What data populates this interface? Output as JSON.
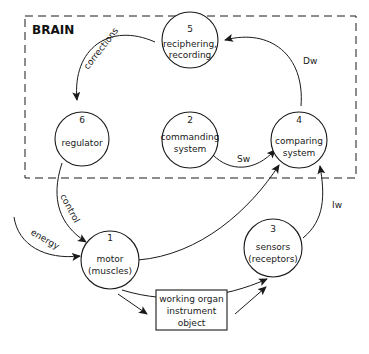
{
  "title": "BRAIN",
  "nodes": {
    "n5": {
      "number": "5",
      "line1": "reciphering,",
      "line2": "recording"
    },
    "n6": {
      "number": "6",
      "line1": "regulator",
      "line2": ""
    },
    "n2": {
      "number": "2",
      "line1": "commanding",
      "line2": "system"
    },
    "n4": {
      "number": "4",
      "line1": "comparing",
      "line2": "system"
    },
    "n1": {
      "number": "1",
      "line1": "motor",
      "line2": "(muscles)"
    },
    "n3": {
      "number": "3",
      "line1": "sensors",
      "line2": "(receptors)"
    },
    "box": {
      "line1": "working organ",
      "line2": "instrument",
      "line3": "object"
    }
  },
  "edges": {
    "corrections": "corrections",
    "dw": "Dw",
    "sw": "Sw",
    "iw": "Iw",
    "control": "control",
    "energy": "energy"
  },
  "colors": {
    "stroke": "#1a1a1a",
    "background": "#ffffff"
  }
}
